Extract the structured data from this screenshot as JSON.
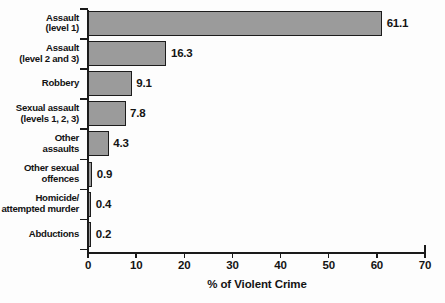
{
  "chart_data": {
    "type": "bar",
    "orientation": "horizontal",
    "title": "",
    "xlabel": "% of Violent Crime",
    "ylabel": "",
    "xlim": [
      0,
      70
    ],
    "xticks": [
      0,
      10,
      20,
      30,
      40,
      50,
      60,
      70
    ],
    "xtick_labels": [
      "0",
      "10",
      "20",
      "30",
      "40",
      "50",
      "60",
      "70"
    ],
    "grid": false,
    "legend": false,
    "categories": [
      "Assault\n(level 1)",
      "Assault\n(level 2 and 3)",
      "Robbery",
      "Sexual assault\n(levels 1, 2, 3)",
      "Other\nassaults",
      "Other sexual\noffences",
      "Homicide/\nattempted murder",
      "Abductions"
    ],
    "values": [
      61.1,
      16.3,
      9.1,
      7.8,
      4.3,
      0.9,
      0.4,
      0.2
    ],
    "value_labels": [
      "61.1",
      "16.3",
      "9.1",
      "7.8",
      "4.3",
      "0.9",
      "0.4",
      "0.2"
    ],
    "bar_fill_color": "#9b9b9b",
    "bar_edge_color": "#1c1c1c",
    "background_color": "#fdfdfd",
    "text_color": "#141414"
  }
}
